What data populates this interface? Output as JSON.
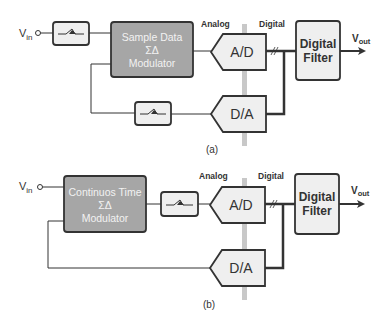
{
  "diagram": {
    "colors": {
      "modulator_fill": "#a6a6a6",
      "block_fill": "#efefef",
      "stroke": "#333333",
      "domain_divider": "#c8c8c8"
    },
    "a": {
      "caption": "(a)",
      "input_label": "V",
      "input_sub": "in",
      "output_label": "V",
      "output_sub": "out",
      "modulator": {
        "line1": "Sample Data",
        "line2": "ΣΔ",
        "line3": "Modulator"
      },
      "adc_label": "A/D",
      "dac_label": "D/A",
      "filter": {
        "line1": "Digital",
        "line2": "Filter"
      },
      "analog_label": "Analog",
      "digital_label": "Digital",
      "input_filter_icon": "lowpass-filter",
      "feedback_filter_icon": "lowpass-filter"
    },
    "b": {
      "caption": "(b)",
      "input_label": "V",
      "input_sub": "in",
      "output_label": "V",
      "output_sub": "out",
      "modulator": {
        "line1": "Continuos Time",
        "line2": "ΣΔ",
        "line3": "Modulator"
      },
      "adc_label": "A/D",
      "dac_label": "D/A",
      "filter": {
        "line1": "Digital",
        "line2": "Filter"
      },
      "analog_label": "Analog",
      "digital_label": "Digital",
      "sampler_icon": "lowpass-filter"
    }
  }
}
